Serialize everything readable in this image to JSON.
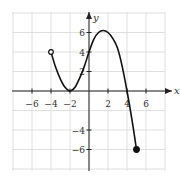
{
  "chart_data": {
    "type": "line",
    "title": "",
    "xlabel": "x",
    "ylabel": "y",
    "xlim": [
      -8,
      8
    ],
    "ylim": [
      -8,
      8
    ],
    "grid": true,
    "grid_step": 2,
    "x_ticks": [
      -6,
      -4,
      -2,
      2,
      4,
      6
    ],
    "y_ticks": [
      -6,
      -4,
      2,
      4,
      6
    ],
    "x_tick_labels": [
      "−6",
      "−4",
      "−2",
      "2",
      "4",
      "6"
    ],
    "y_tick_labels": [
      "−6",
      "−4",
      "2",
      "4",
      "6"
    ],
    "series": [
      {
        "name": "f(x)",
        "x": [
          -4,
          -3.5,
          -3,
          -2.5,
          -2,
          -1.5,
          -1,
          -0.5,
          0,
          0.5,
          1,
          1.5,
          2,
          2.5,
          3,
          3.5,
          4,
          4.5,
          5
        ],
        "y": [
          4,
          2.4,
          1.2,
          0.35,
          0,
          0.35,
          1.3,
          2.5,
          4,
          5.3,
          6.0,
          6.2,
          6.0,
          5.4,
          4.4,
          2.5,
          0,
          -2.8,
          -6
        ]
      }
    ],
    "endpoints": [
      {
        "x": -4,
        "y": 4,
        "style": "open"
      },
      {
        "x": 5,
        "y": -6,
        "style": "closed"
      }
    ],
    "annotations": {
      "local_min": {
        "x": -2,
        "y": 0
      },
      "local_max": {
        "x": 1.5,
        "y": 6.2
      },
      "y_intercept": 4,
      "x_intercepts": [
        -2,
        4
      ]
    }
  },
  "colors": {
    "curve": "#111111",
    "grid": "#d8d8d8",
    "axis": "#222222"
  }
}
